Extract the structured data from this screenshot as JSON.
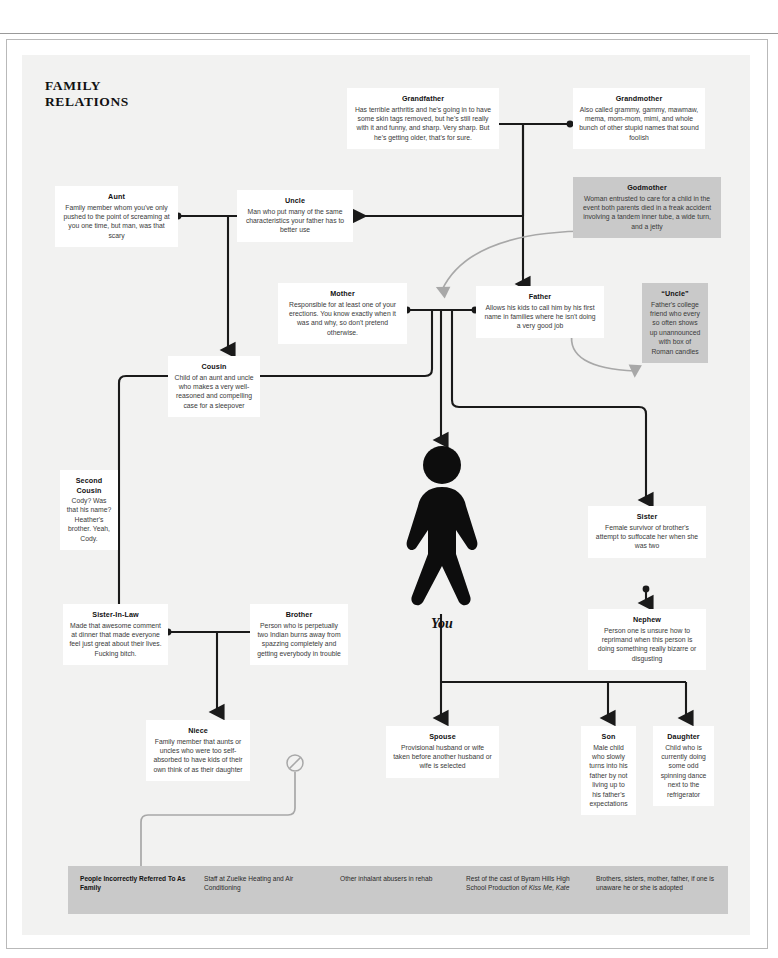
{
  "center": {
    "label": "You",
    "figure_icon": "walking-person-icon"
  },
  "nodes": {
    "grandfather": {
      "name": "Grandfather",
      "desc": "Has terrible arthritis and he's going in to have some skin tags removed, but he's still really with it and funny, and sharp. Very sharp. But he's getting older, that's for sure."
    },
    "grandmother": {
      "name": "Grandmother",
      "desc": "Also called grammy, gammy, mawmaw, mema, mom-mom, mimi, and whole bunch of other stupid names that sound foolish"
    },
    "godmother": {
      "name": "Godmother",
      "desc": "Woman entrusted to care for a child in the event both parents died in a freak accident involving a tandem inner tube, a wide turn, and a jetty"
    },
    "aunt": {
      "name": "Aunt",
      "desc": "Family member whom you've only pushed to the point of screaming at you one time, but man, was that scary"
    },
    "uncle": {
      "name": "Uncle",
      "desc": "Man who put many of the same characteristics your father has to better use"
    },
    "mother": {
      "name": "Mother",
      "desc": "Responsible for at least one of your erections. You know exactly when it was and why, so don't pretend otherwise."
    },
    "father": {
      "name": "Father",
      "desc": "Allows his kids to call him by his first name in families where he isn't doing a very good job"
    },
    "uncle_quoted": {
      "name": "“Uncle”",
      "desc": "Father's college friend who every so often shows up unannounced with box of Roman candles"
    },
    "cousin": {
      "name": "Cousin",
      "desc": "Child of an aunt and uncle who makes a very well-reasoned and compelling case for a sleepover"
    },
    "second_cousin": {
      "name": "Second Cousin",
      "desc": "Cody? Was that his name? Heather's brother. Yeah, Cody."
    },
    "sister": {
      "name": "Sister",
      "desc": "Female survivor of brother's attempt to suffocate her when she was two"
    },
    "nephew": {
      "name": "Nephew",
      "desc": "Person one is unsure how to reprimand when this person is doing something really bizarre or disgusting"
    },
    "sister_in_law": {
      "name": "Sister-In-Law",
      "desc": "Made that awesome comment at dinner that made everyone feel just great about their lives. Fucking bitch."
    },
    "brother": {
      "name": "Brother",
      "desc": "Person who is perpetually two Indian burns away from spazzing completely and getting everybody in trouble"
    },
    "niece": {
      "name": "Niece",
      "desc": "Family member that aunts or uncles who were too self-absorbed to have kids of their own think of as their daughter"
    },
    "spouse": {
      "name": "Spouse",
      "desc": "Provisional husband or wife taken before another husband or wife is selected"
    },
    "son": {
      "name": "Son",
      "desc": "Male child who slowly turns into his father by not living up to his father's expectations"
    },
    "daughter": {
      "name": "Daughter",
      "desc": "Child who is currently doing some odd spinning dance next to the refrigerator"
    }
  },
  "legend": {
    "heading": "People Incorrectly Referred To As Family",
    "items": [
      "Staff at Zuelke Heating and Air Conditioning",
      "Other inhalant abusers in rehab",
      "Rest of the cast of Byram Hills High School Production of Kiss Me, Kate",
      "Brothers, sisters, mother, father, if one is unaware he or she is adopted"
    ],
    "item3_plain_prefix": "Rest of the cast of Byram Hills High School Production of ",
    "item3_italic": "Kiss Me, Kate",
    "no_entry_icon": "circle-slash-icon"
  },
  "colors": {
    "page_bg": "#ffffff",
    "canvas_bg": "#f2f2f1",
    "node_bg": "#ffffff",
    "node_gray_bg": "#c9c9c9",
    "wire_dark": "#1a1a1a",
    "wire_gray": "#a8a8a8",
    "text": "#3a3a3a",
    "heading": "#111111"
  }
}
